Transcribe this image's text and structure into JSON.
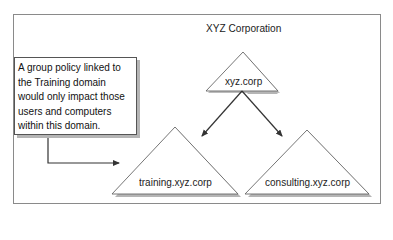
{
  "diagram": {
    "title": "XYZ Corporation",
    "note": {
      "text": "A group policy linked to the Training domain would only impact those users and computers within this domain."
    },
    "nodes": [
      {
        "id": "root",
        "label": "xyz.corp",
        "shape": "triangle"
      },
      {
        "id": "training",
        "label": "training.xyz.corp",
        "shape": "triangle"
      },
      {
        "id": "consulting",
        "label": "consulting.xyz.corp",
        "shape": "triangle"
      }
    ],
    "edges": [
      {
        "from": "root",
        "to": "training",
        "type": "arrow"
      },
      {
        "from": "root",
        "to": "consulting",
        "type": "arrow"
      },
      {
        "from": "note",
        "to": "training",
        "type": "elbow-arrow"
      }
    ],
    "colors": {
      "frame": "#8a8a8a",
      "shadow": "#b5b5b5",
      "line": "#333333",
      "text": "#222222"
    }
  }
}
